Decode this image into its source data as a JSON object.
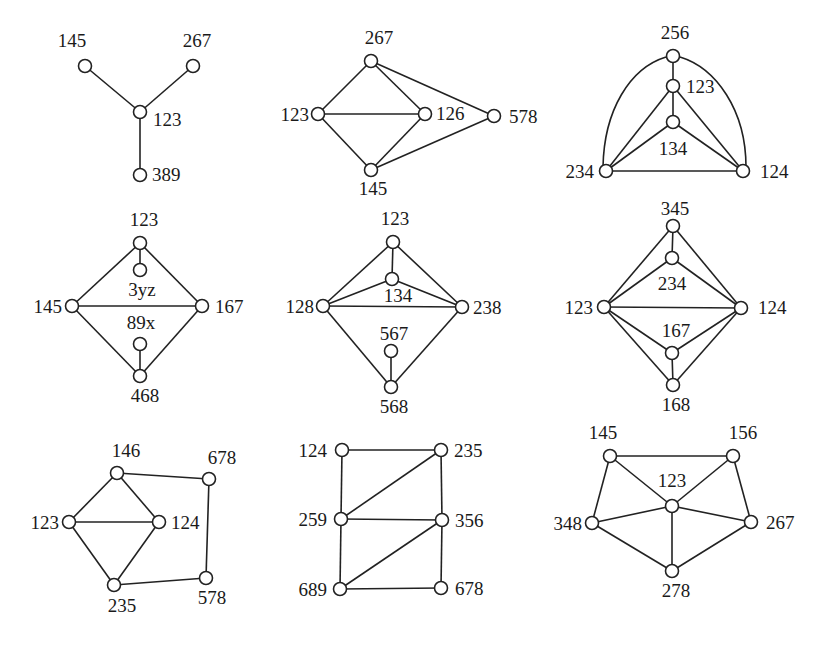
{
  "figure": {
    "node_radius": 6.5,
    "colors": {
      "stroke": "#222222",
      "node_fill": "#ffffff",
      "background": "#ffffff",
      "text": "#1a1a1a"
    }
  },
  "graphs": [
    {
      "id": "g1",
      "nodes": [
        {
          "id": "145",
          "label": "145",
          "x": 85,
          "y": 66,
          "lx": 72,
          "ly": 47,
          "anchor": "middle"
        },
        {
          "id": "267",
          "label": "267",
          "x": 193,
          "y": 66,
          "lx": 197,
          "ly": 47,
          "anchor": "middle"
        },
        {
          "id": "123",
          "label": "123",
          "x": 140,
          "y": 112,
          "lx": 153,
          "ly": 126,
          "anchor": "start"
        },
        {
          "id": "389",
          "label": "389",
          "x": 140,
          "y": 175,
          "lx": 152,
          "ly": 181,
          "anchor": "start"
        }
      ],
      "edges": [
        [
          "145",
          "123"
        ],
        [
          "267",
          "123"
        ],
        [
          "123",
          "389"
        ]
      ]
    },
    {
      "id": "g2",
      "nodes": [
        {
          "id": "267",
          "label": "267",
          "x": 371,
          "y": 61,
          "lx": 379,
          "ly": 44,
          "anchor": "middle"
        },
        {
          "id": "123",
          "label": "123",
          "x": 318,
          "y": 114,
          "lx": 309,
          "ly": 121,
          "anchor": "end"
        },
        {
          "id": "126",
          "label": "126",
          "x": 425,
          "y": 114,
          "lx": 436,
          "ly": 120,
          "anchor": "start"
        },
        {
          "id": "578",
          "label": "578",
          "x": 494,
          "y": 116,
          "lx": 509,
          "ly": 123,
          "anchor": "start"
        },
        {
          "id": "145",
          "label": "145",
          "x": 371,
          "y": 170,
          "lx": 373,
          "ly": 195,
          "anchor": "middle"
        }
      ],
      "edges": [
        [
          "267",
          "123"
        ],
        [
          "267",
          "126"
        ],
        [
          "267",
          "578"
        ],
        [
          "123",
          "126"
        ],
        [
          "123",
          "145"
        ],
        [
          "126",
          "145"
        ],
        [
          "145",
          "578"
        ]
      ]
    },
    {
      "id": "g3",
      "nodes": [
        {
          "id": "256",
          "label": "256",
          "x": 673,
          "y": 56,
          "lx": 675,
          "ly": 39,
          "anchor": "middle"
        },
        {
          "id": "123",
          "label": "123",
          "x": 673,
          "y": 86,
          "lx": 686,
          "ly": 93,
          "anchor": "start"
        },
        {
          "id": "134",
          "label": "134",
          "x": 673,
          "y": 122,
          "lx": 673,
          "ly": 155,
          "anchor": "middle"
        },
        {
          "id": "234",
          "label": "234",
          "x": 606,
          "y": 171,
          "lx": 594,
          "ly": 178,
          "anchor": "end"
        },
        {
          "id": "124",
          "label": "124",
          "x": 743,
          "y": 171,
          "lx": 760,
          "ly": 178,
          "anchor": "start"
        }
      ],
      "edges": [
        [
          "256",
          "123"
        ],
        [
          "123",
          "134"
        ],
        [
          "123",
          "234"
        ],
        [
          "123",
          "124"
        ],
        [
          "134",
          "234"
        ],
        [
          "134",
          "124"
        ],
        [
          "234",
          "124"
        ]
      ],
      "curved_edges": [
        {
          "from": "256",
          "to": "234",
          "path": "M 666 57 C 630 68, 604 110, 603 167"
        },
        {
          "from": "256",
          "to": "124",
          "path": "M 680 57 C 716 68, 746 110, 746 167"
        }
      ]
    },
    {
      "id": "g4",
      "nodes": [
        {
          "id": "123",
          "label": "123",
          "x": 140,
          "y": 243,
          "lx": 144,
          "ly": 226,
          "anchor": "middle"
        },
        {
          "id": "3yz",
          "label": "3yz",
          "x": 140,
          "y": 270,
          "lx": 142,
          "ly": 296,
          "anchor": "middle"
        },
        {
          "id": "145",
          "label": "145",
          "x": 72,
          "y": 306,
          "lx": 62,
          "ly": 313,
          "anchor": "end"
        },
        {
          "id": "167",
          "label": "167",
          "x": 202,
          "y": 306,
          "lx": 215,
          "ly": 313,
          "anchor": "start"
        },
        {
          "id": "89x",
          "label": "89x",
          "x": 140,
          "y": 344,
          "lx": 141,
          "ly": 329,
          "anchor": "middle"
        },
        {
          "id": "468",
          "label": "468",
          "x": 140,
          "y": 376,
          "lx": 145,
          "ly": 402,
          "anchor": "middle"
        }
      ],
      "edges": [
        [
          "123",
          "3yz"
        ],
        [
          "123",
          "145"
        ],
        [
          "123",
          "167"
        ],
        [
          "145",
          "167"
        ],
        [
          "145",
          "468"
        ],
        [
          "167",
          "468"
        ],
        [
          "89x",
          "468"
        ]
      ]
    },
    {
      "id": "g5",
      "nodes": [
        {
          "id": "123",
          "label": "123",
          "x": 393,
          "y": 242,
          "lx": 395,
          "ly": 225,
          "anchor": "middle"
        },
        {
          "id": "134",
          "label": "134",
          "x": 392,
          "y": 279,
          "lx": 398,
          "ly": 302,
          "anchor": "middle"
        },
        {
          "id": "128",
          "label": "128",
          "x": 323,
          "y": 306,
          "lx": 314,
          "ly": 313,
          "anchor": "end"
        },
        {
          "id": "238",
          "label": "238",
          "x": 462,
          "y": 307,
          "lx": 473,
          "ly": 314,
          "anchor": "start"
        },
        {
          "id": "567",
          "label": "567",
          "x": 391,
          "y": 351,
          "lx": 394,
          "ly": 340,
          "anchor": "middle"
        },
        {
          "id": "568",
          "label": "568",
          "x": 391,
          "y": 387,
          "lx": 394,
          "ly": 413,
          "anchor": "middle"
        }
      ],
      "edges": [
        [
          "123",
          "134"
        ],
        [
          "123",
          "128"
        ],
        [
          "123",
          "238"
        ],
        [
          "134",
          "128"
        ],
        [
          "134",
          "238"
        ],
        [
          "128",
          "238"
        ],
        [
          "128",
          "568"
        ],
        [
          "238",
          "568"
        ],
        [
          "567",
          "568"
        ]
      ]
    },
    {
      "id": "g6",
      "nodes": [
        {
          "id": "345",
          "label": "345",
          "x": 673,
          "y": 226,
          "lx": 675,
          "ly": 215,
          "anchor": "middle"
        },
        {
          "id": "234",
          "label": "234",
          "x": 672,
          "y": 258,
          "lx": 672,
          "ly": 290,
          "anchor": "middle"
        },
        {
          "id": "123",
          "label": "123",
          "x": 604,
          "y": 307,
          "lx": 593,
          "ly": 314,
          "anchor": "end"
        },
        {
          "id": "124",
          "label": "124",
          "x": 741,
          "y": 308,
          "lx": 758,
          "ly": 314,
          "anchor": "start"
        },
        {
          "id": "167",
          "label": "167",
          "x": 672,
          "y": 353,
          "lx": 676,
          "ly": 337,
          "anchor": "middle"
        },
        {
          "id": "168",
          "label": "168",
          "x": 673,
          "y": 385,
          "lx": 676,
          "ly": 411,
          "anchor": "middle"
        }
      ],
      "edges": [
        [
          "345",
          "234"
        ],
        [
          "345",
          "123"
        ],
        [
          "345",
          "124"
        ],
        [
          "234",
          "123"
        ],
        [
          "234",
          "124"
        ],
        [
          "123",
          "124"
        ],
        [
          "123",
          "167"
        ],
        [
          "123",
          "168"
        ],
        [
          "124",
          "167"
        ],
        [
          "124",
          "168"
        ],
        [
          "167",
          "168"
        ]
      ]
    },
    {
      "id": "g7",
      "nodes": [
        {
          "id": "146",
          "label": "146",
          "x": 117,
          "y": 473,
          "lx": 126,
          "ly": 457,
          "anchor": "middle"
        },
        {
          "id": "678",
          "label": "678",
          "x": 209,
          "y": 479,
          "lx": 222,
          "ly": 464,
          "anchor": "middle"
        },
        {
          "id": "123",
          "label": "123",
          "x": 69,
          "y": 522,
          "lx": 59,
          "ly": 529,
          "anchor": "end"
        },
        {
          "id": "124",
          "label": "124",
          "x": 159,
          "y": 522,
          "lx": 171,
          "ly": 529,
          "anchor": "start"
        },
        {
          "id": "578",
          "label": "578",
          "x": 206,
          "y": 578,
          "lx": 212,
          "ly": 604,
          "anchor": "middle"
        },
        {
          "id": "235",
          "label": "235",
          "x": 114,
          "y": 585,
          "lx": 122,
          "ly": 612,
          "anchor": "middle"
        }
      ],
      "edges": [
        [
          "146",
          "123"
        ],
        [
          "146",
          "124"
        ],
        [
          "146",
          "678"
        ],
        [
          "123",
          "124"
        ],
        [
          "123",
          "235"
        ],
        [
          "124",
          "235"
        ],
        [
          "678",
          "578"
        ],
        [
          "578",
          "235"
        ]
      ]
    },
    {
      "id": "g8",
      "nodes": [
        {
          "id": "124",
          "label": "124",
          "x": 342,
          "y": 450,
          "lx": 327,
          "ly": 457,
          "anchor": "end"
        },
        {
          "id": "235",
          "label": "235",
          "x": 441,
          "y": 450,
          "lx": 454,
          "ly": 457,
          "anchor": "start"
        },
        {
          "id": "259",
          "label": "259",
          "x": 341,
          "y": 519,
          "lx": 327,
          "ly": 526,
          "anchor": "end"
        },
        {
          "id": "356",
          "label": "356",
          "x": 442,
          "y": 520,
          "lx": 455,
          "ly": 527,
          "anchor": "start"
        },
        {
          "id": "689",
          "label": "689",
          "x": 340,
          "y": 589,
          "lx": 327,
          "ly": 596,
          "anchor": "end"
        },
        {
          "id": "678",
          "label": "678",
          "x": 441,
          "y": 588,
          "lx": 455,
          "ly": 595,
          "anchor": "start"
        }
      ],
      "edges": [
        [
          "124",
          "235"
        ],
        [
          "124",
          "259"
        ],
        [
          "235",
          "259"
        ],
        [
          "235",
          "356"
        ],
        [
          "259",
          "356"
        ],
        [
          "259",
          "689"
        ],
        [
          "356",
          "689"
        ],
        [
          "356",
          "678"
        ],
        [
          "689",
          "678"
        ]
      ]
    },
    {
      "id": "g9",
      "nodes": [
        {
          "id": "145",
          "label": "145",
          "x": 610,
          "y": 456,
          "lx": 603,
          "ly": 439,
          "anchor": "middle"
        },
        {
          "id": "156",
          "label": "156",
          "x": 733,
          "y": 456,
          "lx": 743,
          "ly": 439,
          "anchor": "middle"
        },
        {
          "id": "123",
          "label": "123",
          "x": 672,
          "y": 506,
          "lx": 672,
          "ly": 487,
          "anchor": "middle"
        },
        {
          "id": "348",
          "label": "348",
          "x": 592,
          "y": 523,
          "lx": 582,
          "ly": 530,
          "anchor": "end"
        },
        {
          "id": "267",
          "label": "267",
          "x": 751,
          "y": 522,
          "lx": 766,
          "ly": 529,
          "anchor": "start"
        },
        {
          "id": "278",
          "label": "278",
          "x": 672,
          "y": 571,
          "lx": 676,
          "ly": 597,
          "anchor": "middle"
        }
      ],
      "edges": [
        [
          "145",
          "156"
        ],
        [
          "145",
          "123"
        ],
        [
          "145",
          "348"
        ],
        [
          "156",
          "123"
        ],
        [
          "156",
          "267"
        ],
        [
          "123",
          "348"
        ],
        [
          "123",
          "267"
        ],
        [
          "123",
          "278"
        ],
        [
          "348",
          "278"
        ],
        [
          "267",
          "278"
        ]
      ]
    }
  ]
}
